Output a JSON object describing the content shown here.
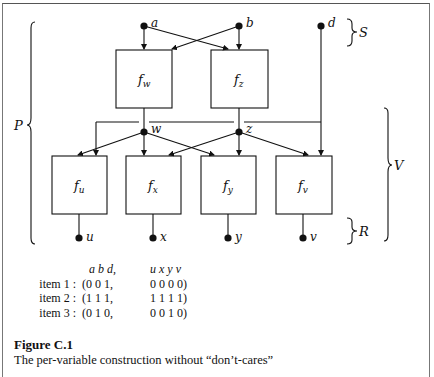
{
  "diagram": {
    "inputs": [
      {
        "id": "a",
        "label": "a"
      },
      {
        "id": "b",
        "label": "b"
      },
      {
        "id": "d",
        "label": "d"
      }
    ],
    "hidden_functions": [
      {
        "id": "fw",
        "label": "f",
        "sub": "w",
        "node": "w"
      },
      {
        "id": "fz",
        "label": "f",
        "sub": "z",
        "node": "z"
      }
    ],
    "output_functions": [
      {
        "id": "fu",
        "label": "f",
        "sub": "u",
        "node": "u"
      },
      {
        "id": "fx",
        "label": "f",
        "sub": "x",
        "node": "x"
      },
      {
        "id": "fy",
        "label": "f",
        "sub": "y",
        "node": "y"
      },
      {
        "id": "fv",
        "label": "f",
        "sub": "v",
        "node": "v"
      }
    ],
    "brace_labels": {
      "S": "S",
      "P": "P",
      "V": "V",
      "R": "R"
    }
  },
  "table": {
    "header_inputs": "a  b  d,",
    "header_outputs": "u  x  y  v",
    "rows": [
      {
        "label": "item 1 :",
        "inputs": "(0  0  1,",
        "outputs": "0  0  0  0)"
      },
      {
        "label": "item 2 :",
        "inputs": "(1  1  1,",
        "outputs": "1  1  1  1)"
      },
      {
        "label": "item 3 :",
        "inputs": "(0  1  0,",
        "outputs": "0  0  1  0)"
      }
    ]
  },
  "figure": {
    "title": "Figure C.1",
    "caption": "The per-variable construction without “don’t-cares”"
  }
}
